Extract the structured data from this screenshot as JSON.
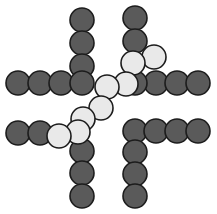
{
  "figure": {
    "width": 217,
    "height": 214,
    "background": "#ffffff",
    "node_radius": 12,
    "stroke_color": "#1c1c1c",
    "stroke_width": 1.6,
    "palette": {
      "dark": "#5a5a5a",
      "light": "#e9e9e9"
    }
  },
  "chart_data": {
    "type": "scatter",
    "title": "",
    "xlabel": "",
    "ylabel": "",
    "xlim": [
      0,
      217
    ],
    "ylim": [
      0,
      214
    ],
    "grid": false,
    "legend": null,
    "marker": "circle",
    "marker_radius": 12,
    "series": [
      {
        "name": "dark-nodes",
        "color": "#5a5a5a",
        "values": [
          {
            "x": 82,
            "y": 20
          },
          {
            "x": 82,
            "y": 43
          },
          {
            "x": 82,
            "y": 66
          },
          {
            "x": 18,
            "y": 83
          },
          {
            "x": 40,
            "y": 83
          },
          {
            "x": 61,
            "y": 83
          },
          {
            "x": 82,
            "y": 83
          },
          {
            "x": 135,
            "y": 18
          },
          {
            "x": 135,
            "y": 41
          },
          {
            "x": 135,
            "y": 83
          },
          {
            "x": 156,
            "y": 83
          },
          {
            "x": 177,
            "y": 83
          },
          {
            "x": 198,
            "y": 83
          },
          {
            "x": 18,
            "y": 133
          },
          {
            "x": 40,
            "y": 133
          },
          {
            "x": 82,
            "y": 151
          },
          {
            "x": 82,
            "y": 173
          },
          {
            "x": 82,
            "y": 196
          },
          {
            "x": 135,
            "y": 131
          },
          {
            "x": 156,
            "y": 131
          },
          {
            "x": 177,
            "y": 131
          },
          {
            "x": 198,
            "y": 131
          },
          {
            "x": 135,
            "y": 152
          },
          {
            "x": 135,
            "y": 174
          },
          {
            "x": 135,
            "y": 196
          }
        ]
      },
      {
        "name": "light-chain",
        "color": "#e9e9e9",
        "values": [
          {
            "x": 154,
            "y": 57
          },
          {
            "x": 133,
            "y": 63
          },
          {
            "x": 126,
            "y": 84
          },
          {
            "x": 107,
            "y": 87
          },
          {
            "x": 101,
            "y": 108
          },
          {
            "x": 83,
            "y": 119
          },
          {
            "x": 78,
            "y": 132
          },
          {
            "x": 59,
            "y": 136
          }
        ]
      }
    ]
  },
  "nodes": [
    {
      "id": "n1",
      "name": "top-left-arm-node-1",
      "x": 82,
      "y": 20,
      "tone": "dark",
      "z": 1
    },
    {
      "id": "n2",
      "name": "top-left-arm-node-2",
      "x": 82,
      "y": 43,
      "tone": "dark",
      "z": 1
    },
    {
      "id": "n3",
      "name": "top-left-arm-node-3",
      "x": 82,
      "y": 66,
      "tone": "dark",
      "z": 1
    },
    {
      "id": "n4",
      "name": "left-arm-node-1",
      "x": 18,
      "y": 83,
      "tone": "dark",
      "z": 1
    },
    {
      "id": "n5",
      "name": "left-arm-node-2",
      "x": 40,
      "y": 83,
      "tone": "dark",
      "z": 1
    },
    {
      "id": "n6",
      "name": "left-arm-node-3",
      "x": 61,
      "y": 83,
      "tone": "dark",
      "z": 1
    },
    {
      "id": "n7",
      "name": "left-arm-node-4",
      "x": 82,
      "y": 83,
      "tone": "dark",
      "z": 1
    },
    {
      "id": "n8",
      "name": "top-right-arm-node-1",
      "x": 135,
      "y": 18,
      "tone": "dark",
      "z": 1
    },
    {
      "id": "n9",
      "name": "top-right-arm-node-2",
      "x": 135,
      "y": 41,
      "tone": "dark",
      "z": 1
    },
    {
      "id": "n10",
      "name": "right-arm-node-1",
      "x": 135,
      "y": 83,
      "tone": "dark",
      "z": 3
    },
    {
      "id": "n11",
      "name": "right-arm-node-2",
      "x": 156,
      "y": 83,
      "tone": "dark",
      "z": 1
    },
    {
      "id": "n12",
      "name": "right-arm-node-3",
      "x": 177,
      "y": 83,
      "tone": "dark",
      "z": 1
    },
    {
      "id": "n13",
      "name": "right-arm-node-4",
      "x": 198,
      "y": 83,
      "tone": "dark",
      "z": 1
    },
    {
      "id": "n14",
      "name": "bottom-left-arm-node-1",
      "x": 18,
      "y": 133,
      "tone": "dark",
      "z": 1
    },
    {
      "id": "n15",
      "name": "bottom-left-arm-node-2",
      "x": 40,
      "y": 133,
      "tone": "dark",
      "z": 1
    },
    {
      "id": "n16",
      "name": "bottom-mid-node-1",
      "x": 82,
      "y": 151,
      "tone": "dark",
      "z": 1
    },
    {
      "id": "n17",
      "name": "bottom-mid-node-2",
      "x": 82,
      "y": 173,
      "tone": "dark",
      "z": 1
    },
    {
      "id": "n18",
      "name": "bottom-mid-node-3",
      "x": 82,
      "y": 196,
      "tone": "dark",
      "z": 1
    },
    {
      "id": "n19",
      "name": "bottom-right-row-node-1",
      "x": 135,
      "y": 131,
      "tone": "dark",
      "z": 1
    },
    {
      "id": "n20",
      "name": "bottom-right-row-node-2",
      "x": 156,
      "y": 131,
      "tone": "dark",
      "z": 1
    },
    {
      "id": "n21",
      "name": "bottom-right-row-node-3",
      "x": 177,
      "y": 131,
      "tone": "dark",
      "z": 1
    },
    {
      "id": "n22",
      "name": "bottom-right-row-node-4",
      "x": 198,
      "y": 131,
      "tone": "dark",
      "z": 1
    },
    {
      "id": "n23",
      "name": "bottom-right-col-node-1",
      "x": 135,
      "y": 152,
      "tone": "dark",
      "z": 1
    },
    {
      "id": "n24",
      "name": "bottom-right-col-node-2",
      "x": 135,
      "y": 174,
      "tone": "dark",
      "z": 1
    },
    {
      "id": "n25",
      "name": "bottom-right-col-node-3",
      "x": 135,
      "y": 196,
      "tone": "dark",
      "z": 1
    },
    {
      "id": "l1",
      "name": "light-chain-node-1",
      "x": 154,
      "y": 57,
      "tone": "light",
      "z": 4
    },
    {
      "id": "l2",
      "name": "light-chain-node-2",
      "x": 133,
      "y": 63,
      "tone": "light",
      "z": 5
    },
    {
      "id": "l3",
      "name": "light-chain-node-3",
      "x": 126,
      "y": 84,
      "tone": "light",
      "z": 6
    },
    {
      "id": "l4",
      "name": "light-chain-node-4",
      "x": 107,
      "y": 87,
      "tone": "light",
      "z": 6
    },
    {
      "id": "l5",
      "name": "light-chain-node-5",
      "x": 101,
      "y": 108,
      "tone": "light",
      "z": 6
    },
    {
      "id": "l6",
      "name": "light-chain-node-6",
      "x": 83,
      "y": 119,
      "tone": "light",
      "z": 6
    },
    {
      "id": "l7",
      "name": "light-chain-node-7",
      "x": 78,
      "y": 132,
      "tone": "light",
      "z": 7
    },
    {
      "id": "l8",
      "name": "light-chain-node-8",
      "x": 59,
      "y": 136,
      "tone": "light",
      "z": 7
    }
  ]
}
